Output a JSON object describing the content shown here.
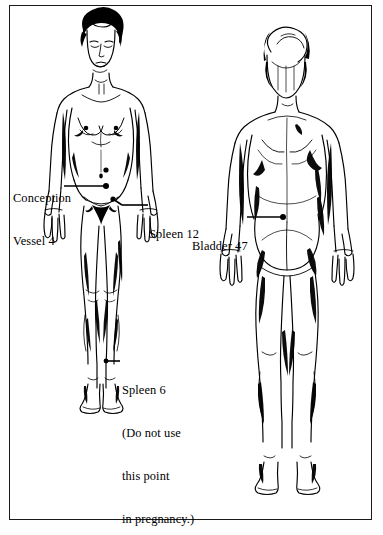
{
  "plate": {
    "title": "Acupressure points on female figures (front and back views)",
    "background_color": "#ffffff",
    "ink_color": "#000000",
    "border_color": "#1a1a1a",
    "figures": [
      {
        "name": "front-view-female-figure",
        "view": "front"
      },
      {
        "name": "back-view-female-figure",
        "view": "back"
      }
    ]
  },
  "annotations": [
    {
      "id": "conception-vessel-4",
      "lines": [
        "Conception",
        "Vessel 4"
      ],
      "point_label": "Conception Vessel 4",
      "figure": "front",
      "region": "lower abdomen"
    },
    {
      "id": "spleen-12",
      "lines": [
        "Spleen 12"
      ],
      "point_label": "Spleen 12",
      "figure": "front",
      "region": "groin / inguinal crease"
    },
    {
      "id": "spleen-6",
      "lines": [
        "Spleen 6",
        "(Do not use",
        "this point",
        "in pregnancy.)"
      ],
      "point_label": "Spleen 6",
      "warning": "(Do not use this point in pregnancy.)",
      "figure": "front",
      "region": "inner ankle"
    },
    {
      "id": "bladder-47",
      "lines": [
        "Bladder 47"
      ],
      "point_label": "Bladder 47",
      "figure": "back",
      "region": "lower back / lumbar"
    }
  ]
}
